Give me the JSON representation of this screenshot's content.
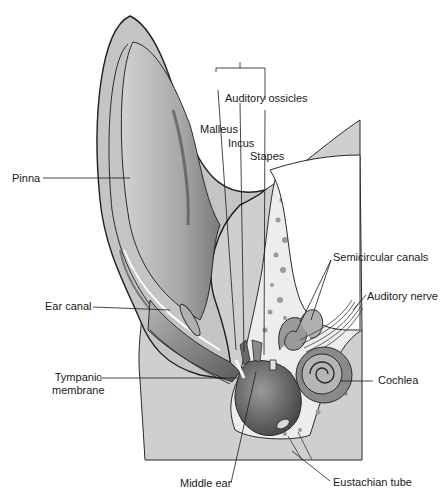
{
  "diagram": {
    "labels": {
      "auditory_ossicles": "Auditory ossicles",
      "malleus": "Malleus",
      "incus": "Incus",
      "stapes": "Stapes",
      "pinna": "Pinna",
      "semicircular_canals": "Semicircular canals",
      "auditory_nerve": "Auditory nerve",
      "ear_canal": "Ear canal",
      "tympanic_membrane_line1": "Tympanic",
      "tympanic_membrane_line2": "membrane",
      "cochlea": "Cochlea",
      "middle_ear": "Middle ear",
      "eustachian_tube": "Eustachian tube"
    },
    "colors": {
      "background": "#ffffff",
      "tissue": "#c8c8c8",
      "tissue_dark": "#8a8a8a",
      "bone": "#f2f2f2",
      "outline": "#2a2a2a",
      "cavity_dark": "#555555"
    }
  }
}
